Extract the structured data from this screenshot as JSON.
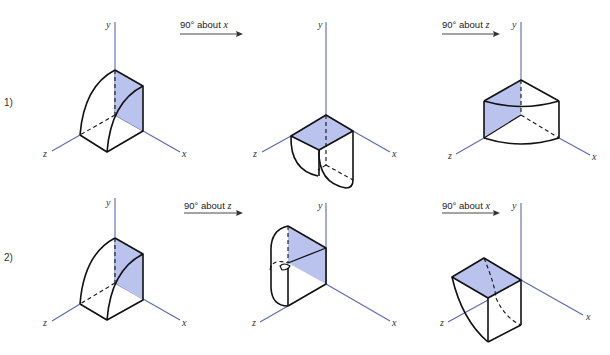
{
  "rows": [
    {
      "label": "1)",
      "steps": [
        {
          "label": "90° about ",
          "axis": "x"
        },
        {
          "label": "90° about ",
          "axis": "z"
        }
      ]
    },
    {
      "label": "2)",
      "steps": [
        {
          "label": "90° about ",
          "axis": "z"
        },
        {
          "label": "90° about ",
          "axis": "x"
        }
      ]
    }
  ],
  "axes": {
    "x": "x",
    "y": "y",
    "z": "z"
  },
  "colors": {
    "axis": "#5a68b4",
    "shaded_face": "#b9c3ee",
    "edge": "#111111"
  }
}
